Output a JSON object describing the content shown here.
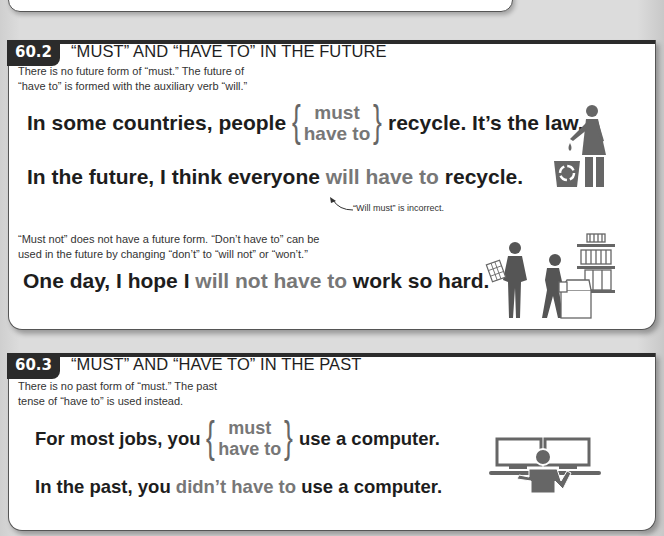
{
  "section_60_2": {
    "number": "60.2",
    "title": "“MUST” AND “HAVE TO” IN THE FUTURE",
    "description_line1": "There is no future form of “must.” The future of",
    "description_line2": "“have to” is formed with the auxiliary verb “will.”",
    "example1": {
      "before": "In some countries, people",
      "option1": "must",
      "option2": "have to",
      "after": "recycle. It’s the law."
    },
    "example2": {
      "before": "In the future, I think everyone",
      "highlight": "will have to",
      "after": "recycle."
    },
    "annotation": "“Will must” is incorrect.",
    "description2_line1": "“Must not” does not have a future form. “Don’t have to” can be",
    "description2_line2": "used in the future by changing “don’t” to “will not” or “won’t.”",
    "example3": {
      "before": "One day, I hope I",
      "highlight": "will not have to",
      "after": "work so hard."
    },
    "illustrations": [
      "person-recycling-icon",
      "workers-warehouse-icon"
    ]
  },
  "section_60_3": {
    "number": "60.3",
    "title": "“MUST” AND “HAVE TO” IN THE PAST",
    "description_line1": "There is no past form of “must.” The past",
    "description_line2": "tense of “have to” is used instead.",
    "example1": {
      "before": "For most jobs, you",
      "option1": "must",
      "option2": "have to",
      "after": "use a computer."
    },
    "example2": {
      "before": "In the past, you",
      "highlight": "didn’t have to",
      "after": "use a computer."
    },
    "illustrations": [
      "person-computer-icon"
    ]
  },
  "colors": {
    "header_dark": "#2b2b2b",
    "highlight_grey": "#777777",
    "icon_grey": "#666666"
  }
}
